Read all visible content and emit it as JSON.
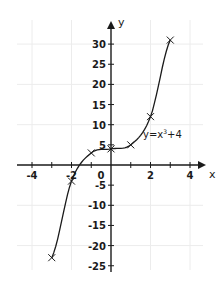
{
  "chart_data": {
    "type": "line",
    "title": "",
    "equation_label": "y=x³+4",
    "equation_text": "y=x",
    "equation_exp": "3",
    "equation_tail": "+4",
    "xlabel": "x",
    "ylabel": "y",
    "xlim": [
      -4.5,
      4.5
    ],
    "ylim": [
      -27,
      33
    ],
    "grid": true,
    "x_ticks": [
      -4,
      -3,
      -2,
      -1,
      1,
      2,
      3,
      4
    ],
    "x_tick_labels": [
      "-4",
      "-2",
      "0",
      "2",
      "4"
    ],
    "x_tick_label_values": [
      -4,
      -2,
      0,
      2,
      4
    ],
    "y_ticks": [
      -25,
      -20,
      -15,
      -10,
      -5,
      5,
      10,
      15,
      20,
      25,
      30
    ],
    "y_tick_labels": [
      "30",
      "25",
      "20",
      "15",
      "10",
      "5",
      "-5",
      "-10",
      "-15",
      "-20",
      "-25"
    ],
    "y_tick_label_values": [
      30,
      25,
      20,
      15,
      10,
      5,
      -5,
      -10,
      -15,
      -20,
      -25
    ],
    "series": [
      {
        "name": "y=x³+4",
        "marker": "x",
        "x": [
          -3,
          -2,
          -1,
          0,
          1,
          2,
          3
        ],
        "values": [
          -23,
          -4,
          3,
          4,
          5,
          12,
          31
        ]
      }
    ],
    "colors": {
      "line": "#1a1a1a",
      "grid": "#ececec",
      "axis": "#1a1a1a"
    }
  }
}
